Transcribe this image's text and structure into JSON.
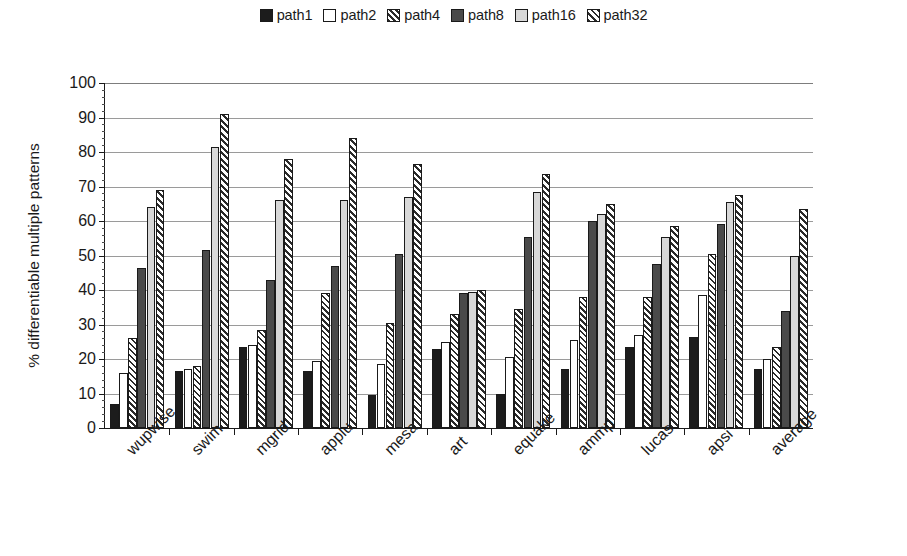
{
  "chart_data": {
    "type": "bar",
    "title": "",
    "xlabel": "",
    "ylabel": "% differentiable multiple patterns",
    "ylim": [
      0,
      100
    ],
    "ytick_step": 10,
    "minor_ticks": true,
    "grid": "horizontal",
    "legend_position": "top-center",
    "categories": [
      "wupwise",
      "swim",
      "mgrid",
      "applu",
      "mesa",
      "art",
      "equake",
      "ammp",
      "lucas",
      "apsi",
      "average"
    ],
    "ytick_labels": [
      "0",
      "10",
      "20",
      "30",
      "40",
      "50",
      "60",
      "70",
      "80",
      "90",
      "100"
    ],
    "series": [
      {
        "name": "path1",
        "fill": "solid-black",
        "color": "#1c1c1c",
        "values": [
          7,
          16.5,
          23.5,
          16.5,
          9.5,
          23,
          10,
          17,
          23.5,
          26.5,
          17
        ]
      },
      {
        "name": "path2",
        "fill": "solid-white",
        "color": "#ffffff",
        "values": [
          16,
          17,
          24,
          19.5,
          18.5,
          25,
          20.5,
          25.5,
          27,
          38.5,
          20
        ]
      },
      {
        "name": "path4",
        "fill": "diagonal-hatch",
        "color": "#ffffff",
        "values": [
          26,
          18,
          28.5,
          39,
          30.5,
          33,
          34.5,
          38,
          38,
          50.5,
          23.5
        ]
      },
      {
        "name": "path8",
        "fill": "solid-dark-gray",
        "color": "#4a4a4a",
        "values": [
          46.5,
          51.5,
          43,
          47,
          50.5,
          39,
          55.5,
          60,
          47.5,
          59,
          34
        ]
      },
      {
        "name": "path16",
        "fill": "solid-light-gray",
        "color": "#d8d8d8",
        "values": [
          64,
          81.5,
          66,
          66,
          67,
          39.5,
          68.5,
          62,
          55.5,
          65.5,
          50
        ]
      },
      {
        "name": "path32",
        "fill": "diagonal-hatch-bold",
        "color": "#ffffff",
        "values": [
          69,
          91,
          78,
          84,
          76.5,
          40,
          73.5,
          65,
          58.5,
          67.5,
          63.5
        ]
      }
    ]
  },
  "legend": {
    "items": [
      {
        "label": "path1",
        "fill": "fill-black"
      },
      {
        "label": "path2",
        "fill": "fill-white"
      },
      {
        "label": "path4",
        "fill": "fill-hatch"
      },
      {
        "label": "path8",
        "fill": "fill-dgray"
      },
      {
        "label": "path16",
        "fill": "fill-lgray"
      },
      {
        "label": "path32",
        "fill": "fill-hatch2"
      }
    ]
  },
  "axis": {
    "y_title": "% differentiable multiple patterns"
  }
}
